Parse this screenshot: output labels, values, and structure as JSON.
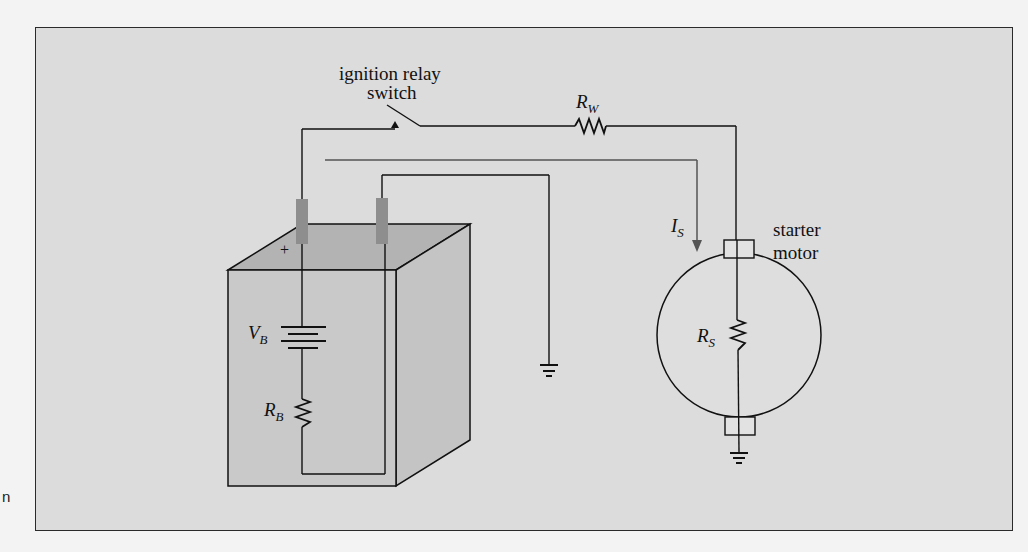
{
  "figure": {
    "side_text": "n",
    "labels": {
      "relay_line1": "ignition relay",
      "relay_line2": "switch",
      "rw_main": "R",
      "rw_sub": "W",
      "is_main": "I",
      "is_sub": "S",
      "motor_line1": "starter",
      "motor_line2": "motor",
      "rs_main": "R",
      "rs_sub": "S",
      "vb_main": "V",
      "vb_sub": "B",
      "rb_main": "R",
      "rb_sub": "B",
      "plus": "+"
    },
    "colors": {
      "frame_bg": "#dcdcdc",
      "battery_front": "#c9c9c9",
      "battery_top": "#b3b3b3",
      "terminal": "#8e8e8e",
      "wire": "#111111",
      "current_arrow": "#555555"
    },
    "components": [
      {
        "id": "battery",
        "symbol": "V_B",
        "type": "voltage-source"
      },
      {
        "id": "battery-resistance",
        "symbol": "R_B",
        "type": "resistor"
      },
      {
        "id": "wire-resistance",
        "symbol": "R_W",
        "type": "resistor"
      },
      {
        "id": "starter-resistance",
        "symbol": "R_S",
        "type": "resistor"
      },
      {
        "id": "ignition-relay-switch",
        "type": "switch"
      },
      {
        "id": "starter-motor",
        "type": "motor"
      },
      {
        "id": "ground-1",
        "type": "ground"
      },
      {
        "id": "ground-2",
        "type": "ground"
      }
    ],
    "current": {
      "symbol": "I_S",
      "direction": "down-into-motor"
    }
  }
}
